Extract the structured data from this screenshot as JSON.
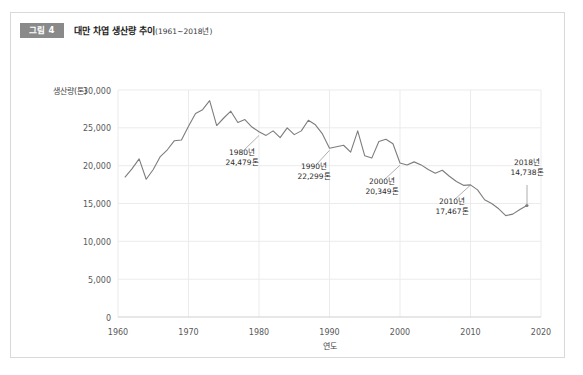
{
  "figure": {
    "number_label": "그림 4",
    "title": "대만 차엽 생산량 추이",
    "title_range": "(1961~2018년)"
  },
  "chart_data": {
    "type": "line",
    "title": "대만 차엽 생산량 추이(1961~2018년)",
    "xlabel": "연도",
    "ylabel": "생산량(톤)",
    "xlim": [
      1960,
      2020
    ],
    "ylim": [
      0,
      30000
    ],
    "grid": true,
    "legend": "none",
    "xticks": [
      "1960",
      "1970",
      "1980",
      "1990",
      "2000",
      "2010",
      "2020"
    ],
    "xtick_values": [
      1960,
      1970,
      1980,
      1990,
      2000,
      2010,
      2020
    ],
    "yticks": [
      "0",
      "5,000",
      "10,000",
      "15,000",
      "20,000",
      "25,000",
      "30,000"
    ],
    "ytick_values": [
      0,
      5000,
      10000,
      15000,
      20000,
      25000,
      30000
    ],
    "series": [
      {
        "name": "대만 차엽 생산량",
        "color": "#7d7d7d",
        "x": [
          1961,
          1962,
          1963,
          1964,
          1965,
          1966,
          1967,
          1968,
          1969,
          1970,
          1971,
          1972,
          1973,
          1974,
          1975,
          1976,
          1977,
          1978,
          1979,
          1980,
          1981,
          1982,
          1983,
          1984,
          1985,
          1986,
          1987,
          1988,
          1989,
          1990,
          1991,
          1992,
          1993,
          1994,
          1995,
          1996,
          1997,
          1998,
          1999,
          2000,
          2001,
          2002,
          2003,
          2004,
          2005,
          2006,
          2007,
          2008,
          2009,
          2010,
          2011,
          2012,
          2013,
          2014,
          2015,
          2016,
          2017,
          2018
        ],
        "values": [
          18500,
          19600,
          20900,
          18200,
          19500,
          21200,
          22100,
          23300,
          23400,
          25200,
          26900,
          27400,
          28600,
          25300,
          26300,
          27200,
          25700,
          26100,
          25100,
          24479,
          24000,
          24600,
          23700,
          25000,
          24100,
          24600,
          26000,
          25400,
          24200,
          22299,
          22500,
          22700,
          21800,
          24600,
          21300,
          21000,
          23200,
          23500,
          22900,
          20349,
          20100,
          20500,
          20100,
          19500,
          19000,
          19400,
          18600,
          17900,
          17400,
          17467,
          16800,
          15500,
          15000,
          14300,
          13400,
          13600,
          14200,
          14738
        ]
      }
    ],
    "annotations": [
      {
        "name": "1980년",
        "year_label": "1980년",
        "value_label": "24,479톤",
        "year": 1980,
        "value": 24479
      },
      {
        "name": "1990년",
        "year_label": "1990년",
        "value_label": "22,299톤",
        "year": 1990,
        "value": 22299
      },
      {
        "name": "2000년",
        "year_label": "2000년",
        "value_label": "20,349톤",
        "year": 2000,
        "value": 20349
      },
      {
        "name": "2010년",
        "year_label": "2010년",
        "value_label": "17,467톤",
        "year": 2010,
        "value": 17467
      },
      {
        "name": "2018년",
        "year_label": "2018년",
        "value_label": "14,738톤",
        "year": 2018,
        "value": 14738
      }
    ]
  },
  "axis": {
    "y_title": "생산량(톤)",
    "x_title": "연도",
    "y_labels": {
      "t0": "0",
      "t1": "5,000",
      "t2": "10,000",
      "t3": "15,000",
      "t4": "20,000",
      "t5": "25,000",
      "t6": "30,000"
    },
    "x_labels": {
      "t0": "1960",
      "t1": "1970",
      "t2": "1980",
      "t3": "1990",
      "t4": "2000",
      "t5": "2010",
      "t6": "2020"
    }
  },
  "annotation_text": {
    "a1_year": "1980년",
    "a1_value": "24,479톤",
    "a2_year": "1990년",
    "a2_value": "22,299톤",
    "a3_year": "2000년",
    "a3_value": "20,349톤",
    "a4_year": "2010년",
    "a4_value": "17,467톤",
    "a5_year": "2018년",
    "a5_value": "14,738톤"
  },
  "colors": {
    "line": "#7d7d7d",
    "grid": "#ebebeb",
    "badge_bg": "#8a8a8a",
    "card_border": "#d9d9d9"
  }
}
